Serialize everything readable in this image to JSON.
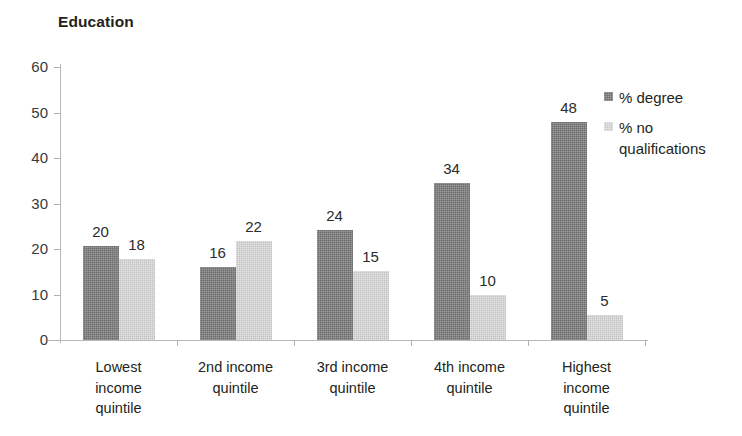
{
  "chart_data": {
    "type": "bar",
    "title": "Education",
    "xlabel": "",
    "ylabel": "",
    "ylim": [
      0,
      60
    ],
    "yticks": [
      0,
      10,
      20,
      30,
      40,
      50,
      60
    ],
    "grid": false,
    "legend_position": "right",
    "categories": [
      "Lowest\nincome\nquintile",
      "2nd income\nquintile",
      "3rd income\nquintile",
      "4th income\nquintile",
      "Highest\nincome\nquintile"
    ],
    "series": [
      {
        "name": "% degree",
        "color": "#6d6d6d",
        "values": [
          20,
          16,
          24,
          34,
          48
        ],
        "plotted_values": [
          20.6,
          16.1,
          24.2,
          34.4,
          48.0
        ]
      },
      {
        "name": "% no qualifications",
        "color": "#c3c3c3",
        "values": [
          18,
          22,
          15,
          10,
          5
        ],
        "plotted_values": [
          17.7,
          21.7,
          15.2,
          9.8,
          5.4
        ]
      }
    ]
  },
  "axis": {
    "tick_labels_y": [
      "60",
      "50",
      "40",
      "30",
      "20",
      "10",
      "0"
    ]
  },
  "legend": {
    "items": [
      {
        "label": "% degree",
        "swatch": "dark-swatch-icon"
      },
      {
        "label": "% no\nqualifications",
        "swatch": "light-swatch-icon"
      }
    ]
  }
}
